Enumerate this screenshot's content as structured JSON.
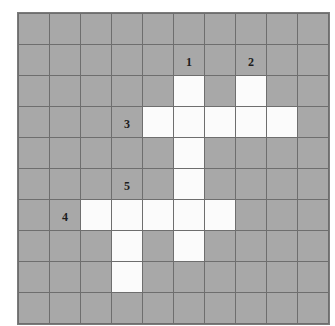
{
  "puzzle": {
    "type": "crossword-grid",
    "rows": 10,
    "columns": 10,
    "cell_size_px": 30,
    "colors": {
      "blocked_cell": "#a8a8a8",
      "open_cell": "#fbfbfb",
      "grid_line": "#6e6e6e",
      "frame": "#7b7b7b",
      "number_text": "#1d1d1d",
      "page_background": "#ffffff"
    },
    "cells": [
      [
        {
          "state": "blocked",
          "number": ""
        },
        {
          "state": "blocked",
          "number": ""
        },
        {
          "state": "blocked",
          "number": ""
        },
        {
          "state": "blocked",
          "number": ""
        },
        {
          "state": "blocked",
          "number": ""
        },
        {
          "state": "blocked",
          "number": ""
        },
        {
          "state": "blocked",
          "number": ""
        },
        {
          "state": "blocked",
          "number": ""
        },
        {
          "state": "blocked",
          "number": ""
        },
        {
          "state": "blocked",
          "number": ""
        }
      ],
      [
        {
          "state": "blocked",
          "number": ""
        },
        {
          "state": "blocked",
          "number": ""
        },
        {
          "state": "blocked",
          "number": ""
        },
        {
          "state": "blocked",
          "number": ""
        },
        {
          "state": "blocked",
          "number": ""
        },
        {
          "state": "blocked",
          "number": "1"
        },
        {
          "state": "blocked",
          "number": ""
        },
        {
          "state": "blocked",
          "number": "2"
        },
        {
          "state": "blocked",
          "number": ""
        },
        {
          "state": "blocked",
          "number": ""
        }
      ],
      [
        {
          "state": "blocked",
          "number": ""
        },
        {
          "state": "blocked",
          "number": ""
        },
        {
          "state": "blocked",
          "number": ""
        },
        {
          "state": "blocked",
          "number": ""
        },
        {
          "state": "blocked",
          "number": ""
        },
        {
          "state": "open",
          "number": ""
        },
        {
          "state": "blocked",
          "number": ""
        },
        {
          "state": "open",
          "number": ""
        },
        {
          "state": "blocked",
          "number": ""
        },
        {
          "state": "blocked",
          "number": ""
        }
      ],
      [
        {
          "state": "blocked",
          "number": ""
        },
        {
          "state": "blocked",
          "number": ""
        },
        {
          "state": "blocked",
          "number": ""
        },
        {
          "state": "blocked",
          "number": "3"
        },
        {
          "state": "open",
          "number": ""
        },
        {
          "state": "open",
          "number": ""
        },
        {
          "state": "open",
          "number": ""
        },
        {
          "state": "open",
          "number": ""
        },
        {
          "state": "open",
          "number": ""
        },
        {
          "state": "blocked",
          "number": ""
        }
      ],
      [
        {
          "state": "blocked",
          "number": ""
        },
        {
          "state": "blocked",
          "number": ""
        },
        {
          "state": "blocked",
          "number": ""
        },
        {
          "state": "blocked",
          "number": ""
        },
        {
          "state": "blocked",
          "number": ""
        },
        {
          "state": "open",
          "number": ""
        },
        {
          "state": "blocked",
          "number": ""
        },
        {
          "state": "blocked",
          "number": ""
        },
        {
          "state": "blocked",
          "number": ""
        },
        {
          "state": "blocked",
          "number": ""
        }
      ],
      [
        {
          "state": "blocked",
          "number": ""
        },
        {
          "state": "blocked",
          "number": ""
        },
        {
          "state": "blocked",
          "number": ""
        },
        {
          "state": "blocked",
          "number": "5"
        },
        {
          "state": "blocked",
          "number": ""
        },
        {
          "state": "open",
          "number": ""
        },
        {
          "state": "blocked",
          "number": ""
        },
        {
          "state": "blocked",
          "number": ""
        },
        {
          "state": "blocked",
          "number": ""
        },
        {
          "state": "blocked",
          "number": ""
        }
      ],
      [
        {
          "state": "blocked",
          "number": ""
        },
        {
          "state": "blocked",
          "number": "4"
        },
        {
          "state": "open",
          "number": ""
        },
        {
          "state": "open",
          "number": ""
        },
        {
          "state": "open",
          "number": ""
        },
        {
          "state": "open",
          "number": ""
        },
        {
          "state": "open",
          "number": ""
        },
        {
          "state": "blocked",
          "number": ""
        },
        {
          "state": "blocked",
          "number": ""
        },
        {
          "state": "blocked",
          "number": ""
        }
      ],
      [
        {
          "state": "blocked",
          "number": ""
        },
        {
          "state": "blocked",
          "number": ""
        },
        {
          "state": "blocked",
          "number": ""
        },
        {
          "state": "open",
          "number": ""
        },
        {
          "state": "blocked",
          "number": ""
        },
        {
          "state": "open",
          "number": ""
        },
        {
          "state": "blocked",
          "number": ""
        },
        {
          "state": "blocked",
          "number": ""
        },
        {
          "state": "blocked",
          "number": ""
        },
        {
          "state": "blocked",
          "number": ""
        }
      ],
      [
        {
          "state": "blocked",
          "number": ""
        },
        {
          "state": "blocked",
          "number": ""
        },
        {
          "state": "blocked",
          "number": ""
        },
        {
          "state": "open",
          "number": ""
        },
        {
          "state": "blocked",
          "number": ""
        },
        {
          "state": "blocked",
          "number": ""
        },
        {
          "state": "blocked",
          "number": ""
        },
        {
          "state": "blocked",
          "number": ""
        },
        {
          "state": "blocked",
          "number": ""
        },
        {
          "state": "blocked",
          "number": ""
        }
      ],
      [
        {
          "state": "blocked",
          "number": ""
        },
        {
          "state": "blocked",
          "number": ""
        },
        {
          "state": "blocked",
          "number": ""
        },
        {
          "state": "blocked",
          "number": ""
        },
        {
          "state": "blocked",
          "number": ""
        },
        {
          "state": "blocked",
          "number": ""
        },
        {
          "state": "blocked",
          "number": ""
        },
        {
          "state": "blocked",
          "number": ""
        },
        {
          "state": "blocked",
          "number": ""
        },
        {
          "state": "blocked",
          "number": ""
        }
      ]
    ]
  }
}
